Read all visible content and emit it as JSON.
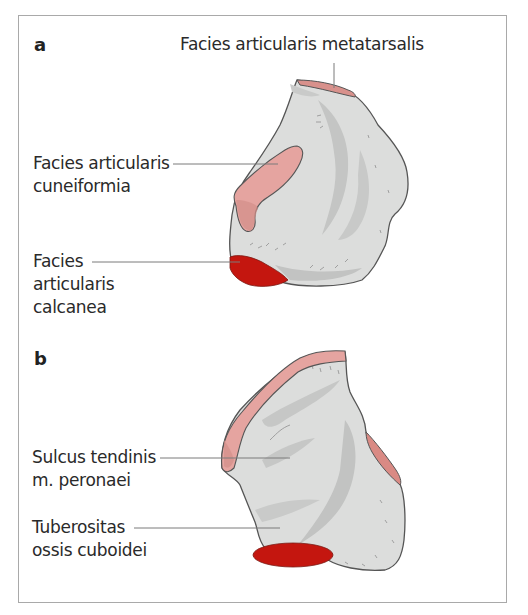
{
  "figure": {
    "panels": [
      {
        "id": "a",
        "letter": "a",
        "labels": {
          "metatarsalis": "Facies articularis metatarsalis",
          "cuneiformia_line1": "Facies articularis",
          "cuneiformia_line2": "cuneiformia",
          "calcanea_line1": "Facies",
          "calcanea_line2": "articularis",
          "calcanea_line3": "calcanea"
        }
      },
      {
        "id": "b",
        "letter": "b",
        "labels": {
          "sulcus_line1": "Sulcus tendinis",
          "sulcus_line2": "m. peronaei",
          "tuberositas_line1": "Tuberositas",
          "tuberositas_line2": "ossis cuboidei"
        }
      }
    ],
    "colors": {
      "bone": "#dcdddc",
      "bone_shadow": "#bfc0bf",
      "outline": "#555555",
      "facet_pink": "#e5a4a0",
      "facet_pink_dark": "#d8918c",
      "facet_red": "#c4160f",
      "leader": "#7a7a7a",
      "frame": "#a9a9a9"
    }
  }
}
